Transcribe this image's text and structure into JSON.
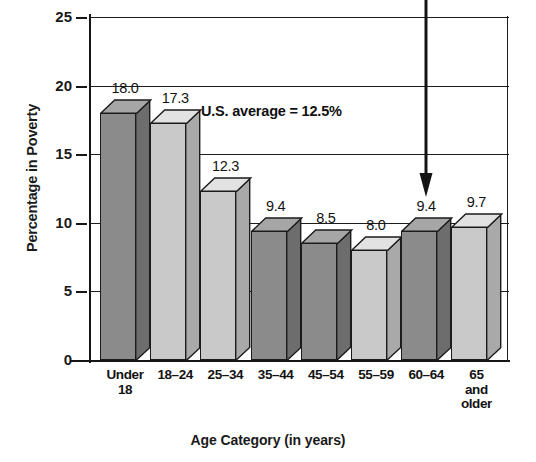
{
  "chart_data": {
    "type": "bar",
    "title": "",
    "xlabel": "Age Category (in years)",
    "ylabel": "Percentage in Poverty",
    "categories": [
      "Under 18",
      "18–24",
      "25–34",
      "35–44",
      "45–54",
      "55–59",
      "60–64",
      "65 and older"
    ],
    "category_lines": [
      [
        "Under",
        "18"
      ],
      [
        "18–24"
      ],
      [
        "25–34"
      ],
      [
        "35–44"
      ],
      [
        "45–54"
      ],
      [
        "55–59"
      ],
      [
        "60–64"
      ],
      [
        "65",
        "and",
        "older"
      ]
    ],
    "values": [
      18.0,
      17.3,
      12.3,
      9.4,
      8.5,
      8.0,
      9.4,
      9.7
    ],
    "value_labels": [
      "18.0",
      "17.3",
      "12.3",
      "9.4",
      "8.5",
      "8.0",
      "9.4",
      "9.7"
    ],
    "ylim": [
      0,
      25
    ],
    "ytick_values": [
      0,
      5,
      10,
      15,
      20,
      25
    ],
    "ytick_labels": [
      "0",
      "5",
      "10",
      "15",
      "20",
      "25"
    ],
    "grid": "horizontal",
    "legend": "none",
    "bar_styles": [
      "dark",
      "light",
      "light",
      "dark",
      "dark",
      "light",
      "dark",
      "light"
    ],
    "annotations": [
      {
        "name": "us-average-note",
        "text": "U.S. average = 12.5%",
        "value": 12.5
      },
      {
        "name": "pointer-arrow",
        "text": "",
        "points_to_category": "60–64"
      }
    ],
    "colors": {
      "bar_dark_front": "#8b8b8b",
      "bar_dark_side": "#6d6d6d",
      "bar_dark_top": "#a6a6a6",
      "bar_light_front": "#c9c9c9",
      "bar_light_side": "#a9a9a9",
      "bar_light_top": "#e2e2e2",
      "outline": "#1b1b1b",
      "axis": "#161616",
      "background": "#ffffff"
    }
  }
}
